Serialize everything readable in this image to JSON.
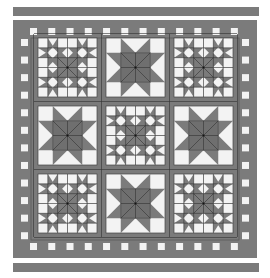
{
  "colors": {
    "background": "#ffffff",
    "dark": "#7b7b7b",
    "medium": "#8e8e8e",
    "light": "#f3f3f3",
    "seam": "#333333"
  },
  "top_bar": {
    "x": 13,
    "y": 7,
    "w": 246,
    "h": 9
  },
  "bottom_bar": {
    "x": 13,
    "y": 263,
    "w": 246,
    "h": 9
  },
  "quilt": {
    "x": 13,
    "y": 20,
    "w": 244,
    "h": 238
  },
  "border": {
    "checker_squares_per_side": 12
  },
  "blocks": {
    "origin_x": 38,
    "origin_y": 38,
    "size": 59,
    "gap": 9,
    "layout": [
      [
        "complex-star",
        "simple-star",
        "complex-star"
      ],
      [
        "simple-star",
        "complex-star",
        "simple-star"
      ],
      [
        "complex-star",
        "simple-star",
        "complex-star"
      ]
    ]
  }
}
